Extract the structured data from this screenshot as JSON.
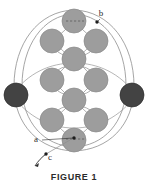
{
  "figure": {
    "caption": "FIGURE 1",
    "background_color": "#ffffff",
    "labels": [
      {
        "id": "label-a",
        "text": "a",
        "x": 36,
        "y": 142
      },
      {
        "id": "label-b",
        "text": "b",
        "x": 99,
        "y": 16
      },
      {
        "id": "label-c",
        "text": "c",
        "x": 50,
        "y": 159
      }
    ],
    "colors": {
      "sphere_light": "#9d9d9d",
      "sphere_light_edge": "#8a8a8a",
      "sphere_dark": "#434343",
      "sphere_dark_edge": "#2e2e2e",
      "orbit_line": "#8e8e8e",
      "bond_line": "#9b9b9b",
      "marker": "#1d1d1d",
      "dashed_axis": "#5a5a5a",
      "label_text": "#2a2a2a",
      "caption_text": "#2b2b2b"
    },
    "geometry": {
      "center_x": 74,
      "center_y": 83,
      "outer_ellipse_rx": 60,
      "outer_ellipse_ry": 72
    },
    "spheres_light": [
      {
        "id": "sphere-top-center",
        "cx": 74,
        "cy": 21,
        "r": 12
      },
      {
        "id": "sphere-upper-left",
        "cx": 52,
        "cy": 41,
        "r": 12
      },
      {
        "id": "sphere-upper-right",
        "cx": 96,
        "cy": 41,
        "r": 12
      },
      {
        "id": "sphere-upper-mid-center",
        "cx": 74,
        "cy": 59,
        "r": 12
      },
      {
        "id": "sphere-mid-left",
        "cx": 52,
        "cy": 80,
        "r": 12
      },
      {
        "id": "sphere-mid-right",
        "cx": 96,
        "cy": 80,
        "r": 12
      },
      {
        "id": "sphere-lower-mid-center",
        "cx": 74,
        "cy": 100,
        "r": 12
      },
      {
        "id": "sphere-lower-left",
        "cx": 52,
        "cy": 120,
        "r": 12
      },
      {
        "id": "sphere-lower-right",
        "cx": 96,
        "cy": 120,
        "r": 12
      },
      {
        "id": "sphere-bottom-center",
        "cx": 74,
        "cy": 140,
        "r": 12
      }
    ],
    "spheres_dark": [
      {
        "id": "sphere-dark-left",
        "cx": 16,
        "cy": 95,
        "r": 12
      },
      {
        "id": "sphere-dark-right",
        "cx": 132,
        "cy": 95,
        "r": 12
      }
    ],
    "markers": [
      {
        "id": "marker-a",
        "cx": 74,
        "cy": 138,
        "r": 1.7
      },
      {
        "id": "marker-b",
        "cx": 97,
        "cy": 22,
        "r": 1.7
      },
      {
        "id": "marker-c",
        "cx": 46,
        "cy": 154,
        "r": 1.7
      }
    ]
  }
}
